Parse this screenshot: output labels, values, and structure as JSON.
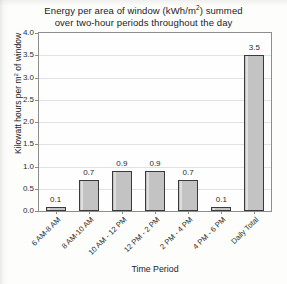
{
  "chart_data": {
    "type": "bar",
    "title_line1": "Energy per area of window (kWh/m",
    "title_line1_sup": "2",
    "title_line1_end": ") summed",
    "title_line2": "over two-hour periods throughout the day",
    "xlabel": "Time Period",
    "ylabel": "Kilowatt hours per m² of window",
    "ylabel_pre": "Kilowatt hours per m",
    "ylabel_sup": "2",
    "ylabel_post": " of window",
    "categories": [
      "6 AM-8 AM",
      "8 AM-10 AM",
      "10 AM - 12 PM",
      "12 PM - 2 PM",
      "2 PM - 4 PM",
      "4 PM - 6 PM",
      "Daily Total"
    ],
    "values": [
      0.1,
      0.7,
      0.9,
      0.9,
      0.7,
      0.1,
      3.5
    ],
    "value_labels": [
      "0.1",
      "0.7",
      "0.9",
      "0.9",
      "0.7",
      "0.1",
      "3.5"
    ],
    "ylim": [
      0.0,
      4.0
    ],
    "ytick_values": [
      4.0,
      3.5,
      3.0,
      2.5,
      2.0,
      1.5,
      1.0,
      0.5,
      0.0
    ],
    "ytick_labels": [
      "4.0",
      "3.5",
      "3.0",
      "2.5",
      "2.0",
      "1.5",
      "1.0",
      "0.5",
      "0.0"
    ],
    "grid": true,
    "grid_axis": "y",
    "legend": false,
    "bar_fill": "#c3c3c3",
    "bar_edge": "#3a3a3a",
    "grid_color": "#e2e2e2",
    "frame_color": "#8d8d8d",
    "background": "#fdfdfb",
    "xtick_rotation": -45
  }
}
